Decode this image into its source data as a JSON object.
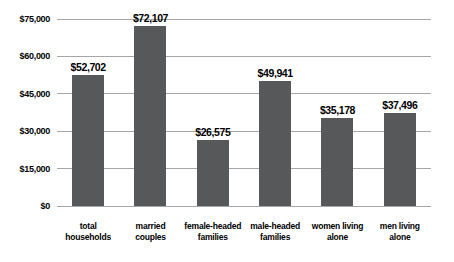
{
  "window": {
    "background": "#ffffff"
  },
  "colors": {
    "bar": "#565859",
    "gridline": "#a6a6a6",
    "axis_line": "#a6a6a6",
    "text": "#000000",
    "background": "#ffffff"
  },
  "chart_data": {
    "type": "bar",
    "title": "",
    "xlabel": "",
    "ylabel": "",
    "categories": [
      "total households",
      "married couples",
      "female-headed families",
      "male-headed families",
      "women living alone",
      "men living alone"
    ],
    "category_lines": [
      [
        "total",
        "households"
      ],
      [
        "married",
        "couples"
      ],
      [
        "female-headed",
        "families"
      ],
      [
        "male-headed",
        "families"
      ],
      [
        "women living",
        "alone"
      ],
      [
        "men living",
        "alone"
      ]
    ],
    "values": [
      52702,
      72107,
      26575,
      49941,
      35178,
      37496
    ],
    "value_labels": [
      "$52,702",
      "$72,107",
      "$26,575",
      "$49,941",
      "$35,178",
      "$37,496"
    ],
    "ylim": [
      0,
      75000
    ],
    "yticks": [
      0,
      15000,
      30000,
      45000,
      60000,
      75000
    ],
    "ytick_labels": [
      "$0",
      "$15,000",
      "$30,000",
      "$45,000",
      "$60,000",
      "$75,000"
    ],
    "grid": true,
    "legend": false
  }
}
